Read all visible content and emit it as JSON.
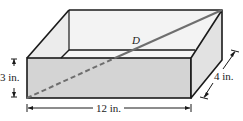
{
  "figure": {
    "type": "rectangular-box-diagonal",
    "labels": {
      "diagonal": "D",
      "height": "3 in.",
      "length": "12 in.",
      "width": "4 in."
    },
    "dimensions": {
      "length_in": 12,
      "width_in": 4,
      "height_in": 3
    },
    "colors": {
      "front_face": "#d4d4d4",
      "side_face": "#e2e2e2",
      "inside": "#f6f6f6",
      "edges": "#1a1a1a",
      "diagonal": "#6e6e6e"
    }
  }
}
